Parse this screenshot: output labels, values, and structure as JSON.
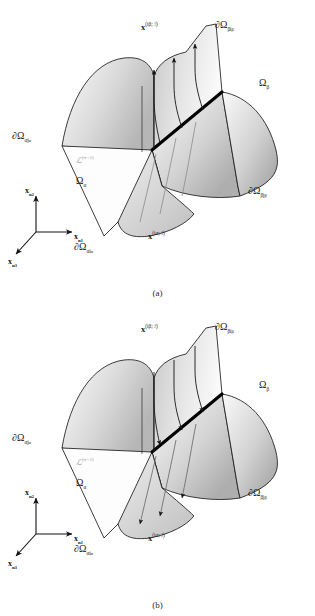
{
  "figure": {
    "background_color": "#ffffff",
    "ink_color": "#1a1a1a",
    "surface_light": "#f2f2f2",
    "surface_mid": "#d8d8d8",
    "surface_dark": "#b4b4b4",
    "interface_color": "#000000",
    "script_color": "#9a9a9a"
  },
  "panels": [
    {
      "id": "a",
      "caption": "(a)",
      "flow_direction": "outflow",
      "labels": {
        "top_flux": "x",
        "top_flux_sup": "(iβ; ℐ)",
        "top_boundary": "∂Ω",
        "top_boundary_sub": "βi",
        "top_boundary_sub2": "β",
        "region_right": "Ω",
        "region_right_sub": "β",
        "region_left": "Ω",
        "region_left_sub": "α",
        "left_boundary": "∂Ω",
        "left_boundary_sub": "αj",
        "left_boundary_sub2": "α",
        "right_boundary": "∂Ω",
        "right_boundary_sub": "βj",
        "right_boundary_sub2": "β",
        "bottom_boundary": "∂Ω",
        "bottom_boundary_sub": "αi",
        "bottom_boundary_sub2": "α",
        "bottom_flux": "x",
        "bottom_flux_sup": "(iα; ℐ)",
        "interface": "ℒ",
        "interface_sup": "(n−2)"
      },
      "axes": {
        "vertical": "x",
        "vertical_sub": "n",
        "vertical_sub2": "2",
        "horizontal": "x",
        "horizontal_sub": "n",
        "horizontal_sub2": "1",
        "diagonal": "x",
        "diagonal_sub": "n",
        "diagonal_sub2": "3"
      }
    },
    {
      "id": "b",
      "caption": "(b)",
      "flow_direction": "inflow",
      "labels": {
        "top_flux": "x",
        "top_flux_sup": "(iβ; ℐ)",
        "top_boundary": "∂Ω",
        "top_boundary_sub": "βi",
        "top_boundary_sub2": "β",
        "region_right": "Ω",
        "region_right_sub": "β",
        "region_left": "Ω",
        "region_left_sub": "α",
        "left_boundary": "∂Ω",
        "left_boundary_sub": "αj",
        "left_boundary_sub2": "α",
        "right_boundary": "∂Ω",
        "right_boundary_sub": "βj",
        "right_boundary_sub2": "β",
        "bottom_boundary": "∂Ω",
        "bottom_boundary_sub": "αi",
        "bottom_boundary_sub2": "α",
        "bottom_flux": "x",
        "bottom_flux_sup": "(iα; ℐ)",
        "interface": "ℒ",
        "interface_sup": "(n−2)"
      },
      "axes": {
        "vertical": "x",
        "vertical_sub": "n",
        "vertical_sub2": "2",
        "horizontal": "x",
        "horizontal_sub": "n",
        "horizontal_sub2": "1",
        "diagonal": "x",
        "diagonal_sub": "n",
        "diagonal_sub2": "3"
      }
    }
  ]
}
